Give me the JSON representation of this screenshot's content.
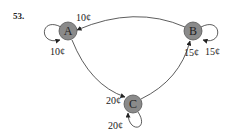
{
  "problem_number": "53.",
  "nodes": [
    {
      "id": "A",
      "label": "A",
      "fill": "#8a8a8a"
    },
    {
      "id": "B",
      "label": "B",
      "fill": "#8a8a8a"
    },
    {
      "id": "C",
      "label": "C",
      "fill": "#8a8a8a"
    }
  ],
  "edges": [
    {
      "from": "B",
      "to": "A",
      "label": "10¢"
    },
    {
      "from": "A",
      "to": "A",
      "label": "10¢"
    },
    {
      "from": "B",
      "to": "B",
      "label": "15¢"
    },
    {
      "from": "C",
      "to": "B",
      "label": "15¢"
    },
    {
      "from": "A",
      "to": "C",
      "label": "20¢"
    },
    {
      "from": "C",
      "to": "C",
      "label": "20¢"
    }
  ]
}
